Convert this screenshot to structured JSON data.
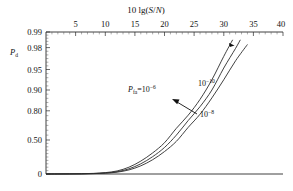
{
  "chart_data": {
    "type": "line",
    "title": "",
    "xlabel": "10 lg(S/N)",
    "ylabel": "P_d",
    "xlabel_parts": {
      "prefix": "10 lg(",
      "x1": "S",
      "slash": "/",
      "x2": "N",
      "suffix": ")"
    },
    "ylabel_parts": {
      "base": "P",
      "sub": "d"
    },
    "x_axis_position": "top",
    "xlim": [
      0,
      40
    ],
    "xticks": [
      5,
      10,
      15,
      20,
      25,
      30,
      35,
      40
    ],
    "xtick_labels": [
      "5",
      "10",
      "15",
      "20",
      "25",
      "30",
      "35",
      "40"
    ],
    "x_minor_step": 1,
    "ylim": [
      0,
      0.99
    ],
    "y_scale": "probability (nonlinear)",
    "yticks": [
      0,
      0.5,
      0.8,
      0.9,
      0.95,
      0.98,
      0.99
    ],
    "ytick_labels": [
      "0",
      "0.50",
      "0.80",
      "0.90",
      "0.95",
      "0.98",
      "0.99"
    ],
    "grid": false,
    "legend_position": "inline-annotations",
    "series": [
      {
        "name": "Pfa = 1e-6",
        "label_base": "P",
        "label_sub": "fa",
        "label_eq": "=10",
        "label_sup": "−6",
        "x": [
          0,
          2,
          4,
          6,
          8,
          10,
          12,
          14,
          16,
          18,
          20,
          22,
          24,
          26,
          28,
          30,
          31.5
        ],
        "y": [
          0.0005,
          0.001,
          0.002,
          0.004,
          0.009,
          0.02,
          0.045,
          0.1,
          0.19,
          0.31,
          0.46,
          0.62,
          0.755,
          0.855,
          0.925,
          0.968,
          0.985
        ]
      },
      {
        "name": "1e-8",
        "label_base": "10",
        "label_sup": "−8",
        "x": [
          0,
          2,
          4,
          6,
          8,
          10,
          12,
          14,
          16,
          18,
          20,
          22,
          24,
          26,
          28,
          30,
          32,
          32.8
        ],
        "y": [
          0.0004,
          0.0008,
          0.0016,
          0.003,
          0.007,
          0.015,
          0.034,
          0.076,
          0.15,
          0.255,
          0.39,
          0.55,
          0.7,
          0.82,
          0.9,
          0.952,
          0.979,
          0.985
        ]
      },
      {
        "name": "1e-10",
        "label_base": "10",
        "label_sup": "−10",
        "x": [
          0,
          2,
          4,
          6,
          8,
          10,
          12,
          14,
          16,
          18,
          20,
          22,
          24,
          26,
          28,
          30,
          32,
          34
        ],
        "y": [
          0.0003,
          0.0006,
          0.0012,
          0.0024,
          0.0055,
          0.012,
          0.027,
          0.06,
          0.12,
          0.21,
          0.33,
          0.48,
          0.63,
          0.765,
          0.862,
          0.925,
          0.962,
          0.982
        ]
      }
    ],
    "annotations": [
      {
        "name": "pfa-1e-6-label",
        "text": "P_fa=10^-6",
        "x_px": 128,
        "y_px": 92
      },
      {
        "name": "pfa-1e-10-label",
        "text": "10^-10",
        "x_px": 198,
        "y_px": 86
      },
      {
        "name": "pfa-1e-8-label",
        "text": "10^-8",
        "x_px": 200,
        "y_px": 117
      },
      {
        "name": "arrow-to-middle-curve",
        "text": "",
        "from_x_px": 197,
        "from_y_px": 114,
        "to_x_px": 172,
        "to_y_px": 99
      }
    ],
    "colors": {
      "curve": "#2b2b2b",
      "axis": "#2b2b2b",
      "text": "#111111",
      "background": "#ffffff"
    }
  },
  "figure": {
    "plot_left_px": 46,
    "plot_right_px": 283,
    "plot_top_px": 32,
    "plot_bottom_px": 174
  }
}
